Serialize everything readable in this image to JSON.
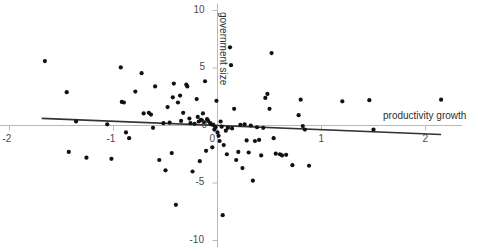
{
  "chart_data": {
    "type": "scatter",
    "title": "",
    "xlabel": "productivity growth",
    "ylabel": "government size",
    "xlim": [
      -2.1,
      2.35
    ],
    "ylim": [
      -10.6,
      10.6
    ],
    "xticks": [
      -2,
      -1,
      0,
      1,
      2
    ],
    "xtick_labels": [
      "-2",
      "-1",
      "0",
      "1",
      "2"
    ],
    "yticks": [
      10,
      5,
      0,
      -5,
      -10
    ],
    "ytick_labels": [
      "10",
      "5",
      "0",
      "-5",
      "-10"
    ],
    "grid": false,
    "legend": null,
    "axis_style": "cross-at-origin",
    "marker": {
      "shape": "circle",
      "size": 2.1,
      "color": "#111111"
    },
    "trendline": {
      "name": "linear fit",
      "color": "#333333",
      "width": 1.6,
      "x_start": -1.69,
      "y_start": 0.62,
      "x_end": 2.15,
      "y_end": -0.78
    },
    "points": [
      {
        "x": -1.66,
        "y": 5.6
      },
      {
        "x": -1.45,
        "y": 2.9
      },
      {
        "x": -1.43,
        "y": -2.3
      },
      {
        "x": -1.36,
        "y": 0.35
      },
      {
        "x": -1.26,
        "y": -2.8
      },
      {
        "x": -1.06,
        "y": 0.1
      },
      {
        "x": -1.02,
        "y": -2.9
      },
      {
        "x": -0.93,
        "y": 5.05
      },
      {
        "x": -0.92,
        "y": 2.05
      },
      {
        "x": -0.9,
        "y": 2.0
      },
      {
        "x": -0.88,
        "y": -0.6
      },
      {
        "x": -0.85,
        "y": -1.1
      },
      {
        "x": -0.79,
        "y": 2.95
      },
      {
        "x": -0.73,
        "y": 4.55
      },
      {
        "x": -0.71,
        "y": 1.05
      },
      {
        "x": -0.66,
        "y": 1.1
      },
      {
        "x": -0.64,
        "y": 0.95
      },
      {
        "x": -0.62,
        "y": -0.2
      },
      {
        "x": -0.6,
        "y": 3.4
      },
      {
        "x": -0.56,
        "y": -3.0
      },
      {
        "x": -0.52,
        "y": 0.2
      },
      {
        "x": -0.5,
        "y": -3.9
      },
      {
        "x": -0.48,
        "y": 1.6
      },
      {
        "x": -0.46,
        "y": 0.25
      },
      {
        "x": -0.44,
        "y": -2.4
      },
      {
        "x": -0.43,
        "y": 2.45
      },
      {
        "x": -0.42,
        "y": 3.65
      },
      {
        "x": -0.4,
        "y": -6.9
      },
      {
        "x": -0.38,
        "y": 2.0
      },
      {
        "x": -0.36,
        "y": 2.6
      },
      {
        "x": -0.35,
        "y": 0.4
      },
      {
        "x": -0.33,
        "y": 1.1
      },
      {
        "x": -0.3,
        "y": 3.55
      },
      {
        "x": -0.29,
        "y": 3.4
      },
      {
        "x": -0.27,
        "y": 0.6
      },
      {
        "x": -0.26,
        "y": 0.2
      },
      {
        "x": -0.24,
        "y": -4.0
      },
      {
        "x": -0.22,
        "y": 0.15
      },
      {
        "x": -0.2,
        "y": 2.3
      },
      {
        "x": -0.19,
        "y": 0.75
      },
      {
        "x": -0.18,
        "y": 0.35
      },
      {
        "x": -0.17,
        "y": -3.1
      },
      {
        "x": -0.16,
        "y": 0.5
      },
      {
        "x": -0.15,
        "y": 0.45
      },
      {
        "x": -0.14,
        "y": 1.05
      },
      {
        "x": -0.13,
        "y": 0.3
      },
      {
        "x": -0.12,
        "y": 3.85
      },
      {
        "x": -0.11,
        "y": -2.2
      },
      {
        "x": -0.1,
        "y": 0.55
      },
      {
        "x": -0.09,
        "y": 0.4
      },
      {
        "x": -0.07,
        "y": 0.2
      },
      {
        "x": -0.06,
        "y": 0.1
      },
      {
        "x": -0.05,
        "y": -1.9
      },
      {
        "x": -0.04,
        "y": 0.05
      },
      {
        "x": -0.03,
        "y": -0.35
      },
      {
        "x": -0.02,
        "y": -0.15
      },
      {
        "x": -0.01,
        "y": 2.15
      },
      {
        "x": 0.0,
        "y": -0.6
      },
      {
        "x": 0.01,
        "y": -0.9
      },
      {
        "x": 0.02,
        "y": -1.35
      },
      {
        "x": 0.03,
        "y": 0.35
      },
      {
        "x": 0.04,
        "y": -0.1
      },
      {
        "x": 0.05,
        "y": -7.8
      },
      {
        "x": 0.06,
        "y": -1.7
      },
      {
        "x": 0.08,
        "y": -0.45
      },
      {
        "x": 0.09,
        "y": -2.5
      },
      {
        "x": 0.1,
        "y": -0.2
      },
      {
        "x": 0.12,
        "y": 6.8
      },
      {
        "x": 0.13,
        "y": 5.25
      },
      {
        "x": 0.14,
        "y": -0.25
      },
      {
        "x": 0.16,
        "y": 1.45
      },
      {
        "x": 0.18,
        "y": -3.0
      },
      {
        "x": 0.2,
        "y": -2.3
      },
      {
        "x": 0.22,
        "y": 0.05
      },
      {
        "x": 0.24,
        "y": -3.7
      },
      {
        "x": 0.26,
        "y": 0.1
      },
      {
        "x": 0.28,
        "y": -1.3
      },
      {
        "x": 0.3,
        "y": -2.35
      },
      {
        "x": 0.32,
        "y": 0.0
      },
      {
        "x": 0.34,
        "y": -4.8
      },
      {
        "x": 0.36,
        "y": -1.35
      },
      {
        "x": 0.38,
        "y": -0.15
      },
      {
        "x": 0.4,
        "y": -1.25
      },
      {
        "x": 0.42,
        "y": -2.6
      },
      {
        "x": 0.44,
        "y": -0.2
      },
      {
        "x": 0.46,
        "y": 2.4
      },
      {
        "x": 0.48,
        "y": 2.75
      },
      {
        "x": 0.5,
        "y": 1.45
      },
      {
        "x": 0.52,
        "y": 6.3
      },
      {
        "x": 0.54,
        "y": -1.1
      },
      {
        "x": 0.56,
        "y": -2.45
      },
      {
        "x": 0.6,
        "y": -2.5
      },
      {
        "x": 0.62,
        "y": -2.6
      },
      {
        "x": 0.66,
        "y": -2.55
      },
      {
        "x": 0.72,
        "y": -3.45
      },
      {
        "x": 0.78,
        "y": 0.9
      },
      {
        "x": 0.8,
        "y": 2.25
      },
      {
        "x": 0.82,
        "y": -0.05
      },
      {
        "x": 0.84,
        "y": -0.35
      },
      {
        "x": 0.88,
        "y": -3.5
      },
      {
        "x": 1.2,
        "y": 2.1
      },
      {
        "x": 1.46,
        "y": 2.2
      },
      {
        "x": 1.5,
        "y": -0.35
      },
      {
        "x": 2.15,
        "y": 2.25
      }
    ]
  }
}
